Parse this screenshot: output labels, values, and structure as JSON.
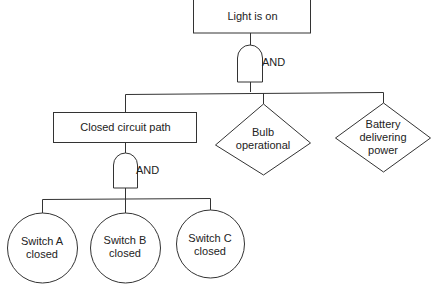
{
  "diagram": {
    "type": "fault-tree",
    "top_event": {
      "label": "Light is on"
    },
    "gate_top": {
      "label": "AND"
    },
    "children": [
      {
        "label": "Closed circuit path",
        "shape": "rectangle"
      },
      {
        "label": "Bulb\noperational",
        "shape": "diamond"
      },
      {
        "label": "Battery\ndelivering\npower",
        "shape": "diamond"
      }
    ],
    "gate_sub": {
      "label": "AND"
    },
    "basic_events": [
      {
        "label": "Switch A\nclosed",
        "shape": "circle"
      },
      {
        "label": "Switch B\nclosed",
        "shape": "circle"
      },
      {
        "label": "Switch C\nclosed",
        "shape": "circle"
      }
    ],
    "colors": {
      "stroke": "#333333",
      "text": "#222222",
      "background": "#ffffff"
    }
  }
}
